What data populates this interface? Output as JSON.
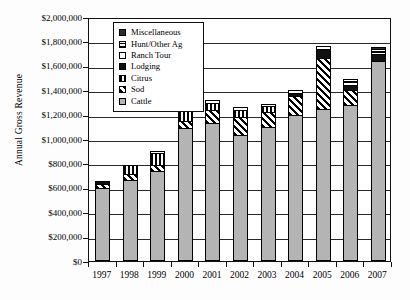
{
  "chart_data": {
    "type": "bar",
    "subtype": "stacked-bar",
    "title": "",
    "xlabel": "",
    "ylabel": "Annual Gross Revenue",
    "ylim": [
      0,
      2000000
    ],
    "ytick_labels": [
      "$0",
      "$200,000",
      "$400,000",
      "$600,000",
      "$800,000",
      "$1,000,000",
      "$1,200,000",
      "$1,400,000",
      "$1,600,000",
      "$1,800,000",
      "$2,000,000"
    ],
    "ytick_values": [
      0,
      200000,
      400000,
      600000,
      800000,
      1000000,
      1200000,
      1400000,
      1600000,
      1800000,
      2000000
    ],
    "grid": true,
    "legend_position": "top-left-inside",
    "categories": [
      "1997",
      "1998",
      "1999",
      "2000",
      "2001",
      "2002",
      "2003",
      "2004",
      "2005",
      "2006",
      "2007"
    ],
    "stack_order_bottom_to_top": [
      "Cattle",
      "Sod",
      "Citrus",
      "Lodging",
      "Ranch Tour",
      "Hunt/Other Ag",
      "Miscellaneous"
    ],
    "series": [
      {
        "name": "Cattle",
        "key": "cattle",
        "pattern": "light-gray-solid",
        "values": [
          600000,
          660000,
          740000,
          1090000,
          1135000,
          1030000,
          1095000,
          1200000,
          1245000,
          1280000,
          1640000
        ]
      },
      {
        "name": "Sod",
        "key": "sod",
        "pattern": "diagonal-hatch",
        "values": [
          35000,
          55000,
          45000,
          55000,
          100000,
          150000,
          125000,
          155000,
          420000,
          120000,
          0
        ]
      },
      {
        "name": "Citrus",
        "key": "citrus",
        "pattern": "vertical-stripe",
        "values": [
          0,
          75000,
          100000,
          110000,
          60000,
          60000,
          50000,
          0,
          0,
          0,
          0
        ]
      },
      {
        "name": "Lodging",
        "key": "lodging",
        "pattern": "black-solid",
        "values": [
          15000,
          0,
          0,
          0,
          0,
          0,
          0,
          25000,
          70000,
          45000,
          55000
        ]
      },
      {
        "name": "Ranch Tour",
        "key": "ranchtour",
        "pattern": "white-solid",
        "values": [
          0,
          0,
          20000,
          25000,
          25000,
          20000,
          20000,
          20000,
          25000,
          25000,
          20000
        ]
      },
      {
        "name": "Hunt/Other Ag",
        "key": "hunt",
        "pattern": "cross-hatch",
        "values": [
          0,
          0,
          0,
          25000,
          0,
          0,
          0,
          0,
          0,
          25000,
          25000
        ]
      },
      {
        "name": "Miscellaneous",
        "key": "misc",
        "pattern": "dark-solid",
        "values": [
          0,
          0,
          0,
          0,
          0,
          0,
          0,
          0,
          0,
          0,
          10000
        ]
      }
    ],
    "totals": [
      650000,
      790000,
      905000,
      1305000,
      1320000,
      1260000,
      1290000,
      1400000,
      1760000,
      1495000,
      1750000
    ]
  },
  "legend": {
    "items": [
      {
        "label": "Miscellaneous",
        "key": "misc"
      },
      {
        "label": "Hunt/Other Ag",
        "key": "hunt"
      },
      {
        "label": "Ranch Tour",
        "key": "ranchtour"
      },
      {
        "label": "Lodging",
        "key": "lodging"
      },
      {
        "label": "Citrus",
        "key": "citrus"
      },
      {
        "label": "Sod",
        "key": "sod"
      },
      {
        "label": "Cattle",
        "key": "cattle"
      }
    ]
  },
  "colors": {
    "cattle_gray": "#b4b4b4",
    "ink": "#111111",
    "background": "#ffffff"
  }
}
